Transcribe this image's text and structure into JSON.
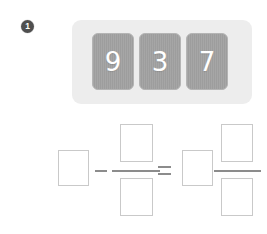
{
  "problem": {
    "number": "1",
    "badge_color": "#4f4f4f"
  },
  "tile_panel": {
    "background_color": "#ededed",
    "tile_color": "#9d9d9d",
    "tile_text_color": "#ffffff",
    "tiles": [
      {
        "name": "digit-tile-9",
        "value": "9"
      },
      {
        "name": "digit-tile-3",
        "value": "3"
      },
      {
        "name": "digit-tile-7",
        "value": "7"
      }
    ]
  },
  "equation": {
    "operator_color": "#8c8c8c",
    "box_border_color": "#c9c9c9",
    "minus_symbol": "−",
    "equals_symbol": "=",
    "boxes": {
      "minuend": "",
      "numerator_left": "",
      "denominator_left": "",
      "whole_right": "",
      "numerator_right": "",
      "denominator_right": ""
    }
  }
}
